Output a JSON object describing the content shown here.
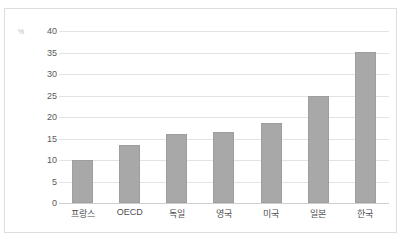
{
  "artifact": {
    "top_fragment": "· ·  ——   ···   ————"
  },
  "chart_data": {
    "type": "bar",
    "title": "",
    "subtitle": "",
    "xlabel": "",
    "ylabel": "",
    "unit_label": "%",
    "categories": [
      "프랑스",
      "OECD",
      "독일",
      "영국",
      "미국",
      "일본",
      "한국"
    ],
    "values": [
      10.0,
      13.5,
      16.1,
      16.5,
      18.5,
      24.9,
      35.2
    ],
    "ylim": [
      0,
      40
    ],
    "ytick_step": 5,
    "yticks": [
      0,
      5,
      10,
      15,
      20,
      25,
      30,
      35,
      40
    ],
    "ytick_labels": [
      "0",
      "5",
      "10",
      "15",
      "20",
      "25",
      "30",
      "35",
      "40"
    ],
    "grid": true,
    "grid_axis": "y",
    "legend": false,
    "legend_position": "none",
    "orientation": "vertical",
    "colors": {
      "bar_fill": "#a8a8a8",
      "bar_border": "#9e9e9e",
      "gridline": "#e3e3e3",
      "baseline": "#cfcfcf",
      "frame_border": "#dededd",
      "tick_text": "#59595a",
      "category_text": "#4e4e4f",
      "background": "#ffffff"
    }
  }
}
